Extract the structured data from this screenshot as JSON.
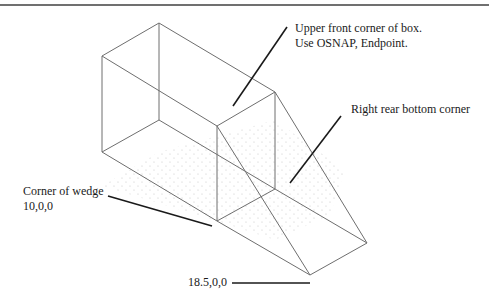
{
  "diagram": {
    "type": "isometric wireframe drawing of a box with attached wedge",
    "colors": {
      "edge": "#6e6e6e",
      "leader": "#1a1a1a",
      "grid_dot": "#c4c4c4",
      "rule": "#707070"
    },
    "callouts": [
      {
        "id": "upper-front-corner",
        "lines": [
          "Upper front corner of box.",
          "Use OSNAP, Endpoint."
        ],
        "x": 295,
        "y": 22,
        "leader": [
          [
            287,
            27
          ],
          [
            233,
            106
          ]
        ]
      },
      {
        "id": "right-rear-bottom",
        "lines": [
          "Right rear bottom corner"
        ],
        "x": 351,
        "y": 104,
        "leader": [
          [
            341,
            116
          ],
          [
            290,
            183
          ]
        ]
      },
      {
        "id": "corner-of-wedge",
        "lines": [
          "Corner of wedge",
          "10,0,0"
        ],
        "x": 23,
        "y": 185,
        "leader": [
          [
            108,
            196
          ],
          [
            212,
            226
          ]
        ]
      },
      {
        "id": "wedge-tip",
        "lines": [
          "18.5,0,0"
        ],
        "x": 188,
        "y": 274,
        "leader": [
          [
            232,
            283
          ],
          [
            310,
            283
          ]
        ]
      }
    ]
  }
}
